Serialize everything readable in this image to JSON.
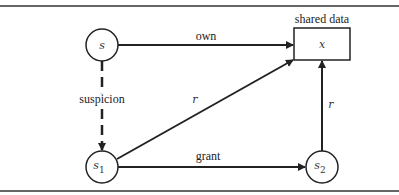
{
  "diagram": {
    "nodes": {
      "s": {
        "label": "s"
      },
      "s1": {
        "label": "s",
        "sub": "1"
      },
      "s2": {
        "label": "s",
        "sub": "2"
      },
      "x": {
        "label": "x",
        "caption": "shared data"
      }
    },
    "edges": {
      "own": "own",
      "suspicion": "suspicion",
      "r1": "r",
      "grant": "grant",
      "r2": "r"
    }
  }
}
